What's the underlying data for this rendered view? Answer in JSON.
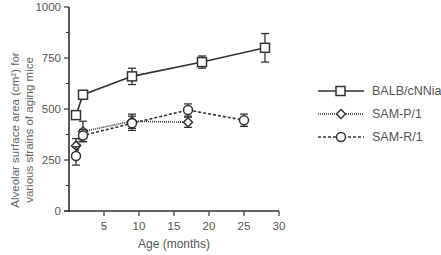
{
  "chart_data": {
    "type": "line",
    "title": "",
    "xlabel": "Age (months)",
    "ylabel": "Alveolar surface area (cm2) for various strains of aging mice",
    "ylabel_line1": "Alveolar surface area (cm²) for",
    "ylabel_line2": "various strains of aging mice",
    "xlim": [
      0,
      30
    ],
    "ylim": [
      0,
      1000
    ],
    "xticks": [
      5,
      10,
      15,
      20,
      25,
      30
    ],
    "yticks": [
      0,
      250,
      500,
      750,
      1000
    ],
    "grid": false,
    "legend_position": "right",
    "series": [
      {
        "name": "BALB/cNNia",
        "marker": "square",
        "line": "solid",
        "x": [
          1,
          2,
          9,
          19,
          28
        ],
        "values": [
          470,
          570,
          660,
          730,
          800
        ],
        "error": [
          15,
          15,
          40,
          30,
          70
        ]
      },
      {
        "name": "SAM-P/1",
        "marker": "diamond",
        "line": "dotted",
        "x": [
          1,
          2,
          9,
          17
        ],
        "values": [
          320,
          390,
          440,
          435
        ],
        "error": [
          35,
          50,
          35,
          25
        ]
      },
      {
        "name": "SAM-R/1",
        "marker": "circle",
        "line": "dashed",
        "x": [
          1,
          2,
          9,
          17,
          25
        ],
        "values": [
          270,
          370,
          430,
          495,
          445
        ],
        "error": [
          45,
          30,
          35,
          30,
          30
        ]
      }
    ]
  },
  "legend": {
    "items": [
      {
        "label": "BALB/cNNia"
      },
      {
        "label": "SAM-P/1"
      },
      {
        "label": "SAM-R/1"
      }
    ]
  },
  "colors": {
    "axis": "#333333",
    "text": "#555555",
    "series": "#333333"
  }
}
